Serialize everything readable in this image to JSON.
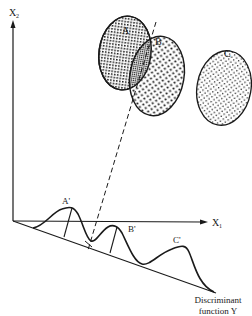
{
  "diagram": {
    "axes": {
      "y_label": "X",
      "y_label_sub": "2",
      "x_label": "X",
      "x_label_sub": "1"
    },
    "groups": [
      {
        "name": "A",
        "pattern": "crosshatch"
      },
      {
        "name": "B",
        "pattern": "dots"
      },
      {
        "name": "C",
        "pattern": "fine-dots"
      }
    ],
    "projections": [
      {
        "label": "A'"
      },
      {
        "label": "B'"
      },
      {
        "label": "C'"
      }
    ],
    "discriminant": {
      "label_line1": "Discriminant",
      "label_line2": "function Y"
    },
    "colors": {
      "ink": "#1a1a1a",
      "background": "#ffffff"
    }
  }
}
